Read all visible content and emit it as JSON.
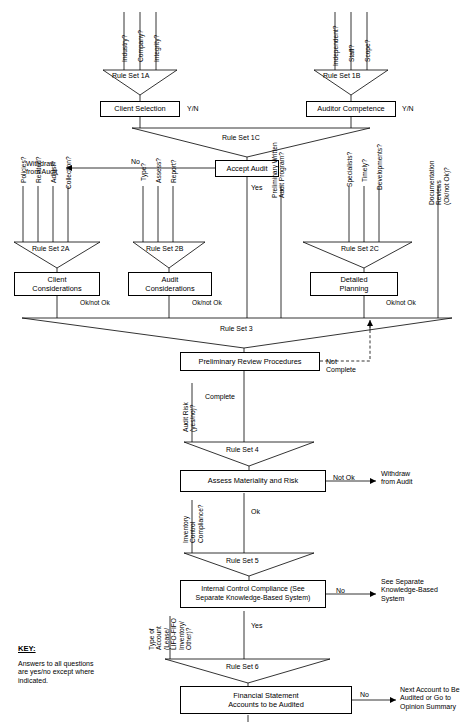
{
  "rule_sets": {
    "rs1a": "Rule Set 1A",
    "rs1b": "Rule Set 1B",
    "rs1c": "Rule Set 1C",
    "rs2a": "Rule Set 2A",
    "rs2b": "Rule Set 2B",
    "rs2c": "Rule Set 2C",
    "rs3": "Rule Set 3",
    "rs4": "Rule Set 4",
    "rs5": "Rule Set 5",
    "rs6": "Rule Set 6"
  },
  "inputs_1a": [
    "Industry?",
    "Company?",
    "Integrity?"
  ],
  "inputs_1b": [
    "Independent?",
    "Staff?",
    "Scope?"
  ],
  "inputs_2a": [
    "Policies?",
    "Related?",
    "Adjust?",
    "Collection?"
  ],
  "inputs_2b": [
    "Type?",
    "Assess?",
    "Report?"
  ],
  "inputs_2c": [
    "Specialists?",
    "Timely?",
    "Developments?"
  ],
  "vertical_feeds": {
    "prelim_program": "Preliminary Written\nAudit Program?",
    "documentation": "Documentation\nReviews (Ok/not Ok)?",
    "audit_risk": "Audit Risk\n(yes/no)?",
    "inventory_control": "Inventory\nControl\nCompliance?",
    "type_of_account": "Type of\nAccount\n(Lease/\nLIFO-FIFO\nInventory/\nOther)?"
  },
  "boxes": {
    "client_selection": "Client Selection",
    "auditor_competence": "Auditor Competence",
    "accept_audit": "Accept Audit",
    "client_considerations": "Client\nConsiderations",
    "audit_considerations": "Audit\nConsiderations",
    "detailed_planning": "Detailed\nPlanning",
    "prelim_review": "Preliminary Review Procedures",
    "assess_materiality": "Assess Materiality and Risk",
    "internal_control": "Internal Control Compliance (See\nSeparate Knowledge-Based System)",
    "financial_statement": "Financial Statement\nAccounts to be Audited"
  },
  "edge_labels": {
    "yn_client": "Y/N",
    "yn_auditor": "Y/N",
    "no_accept": "No",
    "yes_accept": "Yes",
    "ok_not_ok_1": "Ok/not Ok",
    "ok_not_ok_2": "Ok/not Ok",
    "ok_not_ok_3": "Ok/not Ok",
    "not_complete": "Not\nComplete",
    "complete": "Complete",
    "not_ok_materiality": "Not Ok",
    "ok_materiality": "Ok",
    "no_internal": "No",
    "yes_internal": "Yes",
    "no_financial": "No"
  },
  "terminals": {
    "withdraw_1": "Withdraw\nfrom Audit",
    "withdraw_2": "Withdraw\nfrom Audit",
    "see_separate": "See Separate\nKnowledge-Based\nSystem",
    "next_account": "Next Account to Be\nAudited or Go to\nOpinion Summary",
    "see_figs": "See Figs. 11-7B\nand 11-7C"
  },
  "key": {
    "heading": "KEY:",
    "body": "Answers to all questions\nare yes/no except where\nindicated."
  },
  "colors": {
    "line": "#000000",
    "background": "#ffffff",
    "text": "#000000"
  }
}
